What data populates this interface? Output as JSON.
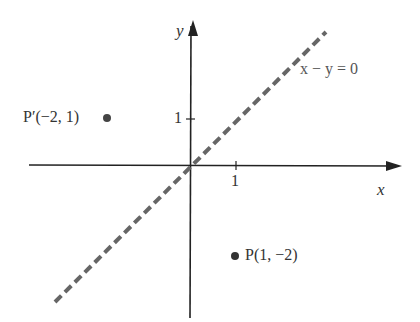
{
  "diagram": {
    "type": "coordinate-plane",
    "axes": {
      "x_label": "x",
      "y_label": "y",
      "x_tick": "1",
      "y_tick": "1"
    },
    "line": {
      "equation": "x − y = 0",
      "style": "dashed",
      "color": "#666666"
    },
    "points": [
      {
        "name": "P'",
        "label": "P′(−2, 1)",
        "x": -2,
        "y": 1
      },
      {
        "name": "P",
        "label": "P(1, −2)",
        "x": 1,
        "y": -2
      }
    ],
    "colors": {
      "axis": "#222222",
      "point": "#444444",
      "line": "#666666"
    }
  }
}
